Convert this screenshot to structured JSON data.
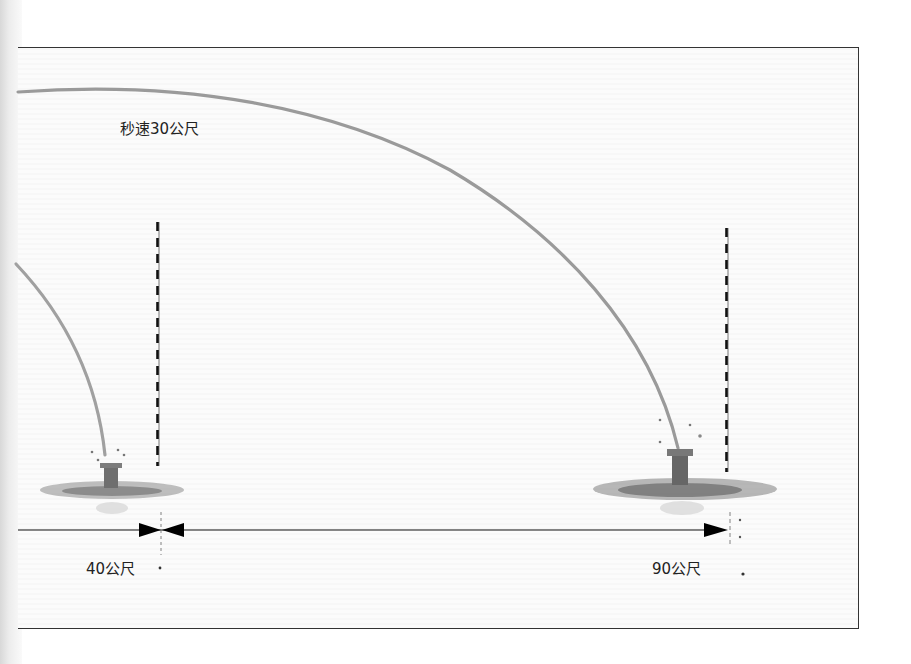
{
  "diagram": {
    "speed_label": "秒速30公尺",
    "distances": [
      {
        "label": "40公尺",
        "value_m": 40
      },
      {
        "label": "90公尺",
        "value_m": 90
      }
    ],
    "colors": {
      "arc": "#9a9a9a",
      "frame": "#333333",
      "dimension_line": "#111111",
      "puddle": "#7a7a7a"
    }
  }
}
